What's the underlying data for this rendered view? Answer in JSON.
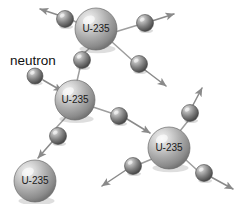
{
  "figure": {
    "name": "nuclear-fission-chain-reaction",
    "background_color": "#ffffff",
    "width": 241,
    "height": 204,
    "colors": {
      "sphere_light": "#e8e8e8",
      "sphere_mid": "#9a9a9a",
      "sphere_dark": "#5a5a5a",
      "neutron_light": "#d8d8d8",
      "neutron_mid": "#7d7d7d",
      "neutron_dark": "#3c3c3c",
      "arrow": "#8a8a8a",
      "link": "#9e9e9e",
      "text": "#111111",
      "outline": "#6b6b6b"
    }
  },
  "labels": {
    "neutron_caption": "neutron",
    "atom_symbol": "U-235"
  },
  "atoms": [
    {
      "id": "u235-top",
      "label": "U-235",
      "cx": 96,
      "cy": 29,
      "r": 21
    },
    {
      "id": "u235-middle",
      "label": "U-235",
      "cx": 75,
      "cy": 100,
      "r": 20
    },
    {
      "id": "u235-right",
      "label": "U-235",
      "cx": 169,
      "cy": 148,
      "r": 21
    },
    {
      "id": "u235-bottom-left",
      "label": "U-235",
      "cx": 35,
      "cy": 181,
      "r": 21
    }
  ],
  "neutrons": [
    {
      "id": "neutron-incoming",
      "cx": 35,
      "cy": 76,
      "r": 8
    },
    {
      "id": "neutron-mid-to-top",
      "cx": 82,
      "cy": 60,
      "r": 8.5
    },
    {
      "id": "neutron-top-left",
      "cx": 65,
      "cy": 19,
      "r": 8.5
    },
    {
      "id": "neutron-top-right",
      "cx": 145,
      "cy": 23,
      "r": 8.5
    },
    {
      "id": "neutron-top-lower-right",
      "cx": 139,
      "cy": 64,
      "r": 8.5
    },
    {
      "id": "neutron-mid-to-right",
      "cx": 119,
      "cy": 116,
      "r": 8.5
    },
    {
      "id": "neutron-mid-to-bottom",
      "cx": 58,
      "cy": 136,
      "r": 8.5
    },
    {
      "id": "neutron-right-upper",
      "cx": 190,
      "cy": 113,
      "r": 8.5
    },
    {
      "id": "neutron-right-lower-left",
      "cx": 133,
      "cy": 166,
      "r": 8.5
    },
    {
      "id": "neutron-right-lower-right",
      "cx": 204,
      "cy": 173,
      "r": 8.5
    }
  ],
  "links": [
    {
      "id": "link-top-to-topleft-neutron",
      "x1": 78,
      "y1": 23,
      "x2": 72,
      "y2": 20
    },
    {
      "id": "link-top-to-topright-neutron",
      "x1": 115,
      "y1": 32,
      "x2": 138,
      "y2": 25
    },
    {
      "id": "link-top-to-lowerright-neutron",
      "x1": 112,
      "y1": 42,
      "x2": 132,
      "y2": 60
    },
    {
      "id": "link-top-to-midneutron",
      "x1": 90,
      "y1": 48,
      "x2": 84,
      "y2": 53
    },
    {
      "id": "link-midneutron-to-mid",
      "x1": 80,
      "y1": 68,
      "x2": 77,
      "y2": 81
    },
    {
      "id": "link-mid-to-rightneutron",
      "x1": 93,
      "y1": 107,
      "x2": 111,
      "y2": 113
    },
    {
      "id": "link-mid-to-bottomneutron",
      "x1": 66,
      "y1": 117,
      "x2": 56,
      "y2": 128
    },
    {
      "id": "link-right-to-upperneutron",
      "x1": 180,
      "y1": 131,
      "x2": 188,
      "y2": 121
    },
    {
      "id": "link-right-to-lowerleftneutron",
      "x1": 152,
      "y1": 159,
      "x2": 140,
      "y2": 164
    },
    {
      "id": "link-right-to-lowerrightneutron",
      "x1": 186,
      "y1": 160,
      "x2": 197,
      "y2": 170
    }
  ],
  "arrows": [
    {
      "id": "arrow-incoming-neutron",
      "x1": 43,
      "y1": 80,
      "x2": 62,
      "y2": 91,
      "head": "end"
    },
    {
      "id": "arrow-escape-top-left",
      "x1": 58,
      "y1": 15,
      "x2": 40,
      "y2": 9,
      "head": "end"
    },
    {
      "id": "arrow-escape-top-right",
      "x1": 152,
      "y1": 21,
      "x2": 174,
      "y2": 14,
      "head": "end"
    },
    {
      "id": "arrow-escape-lower-right",
      "x1": 145,
      "y1": 70,
      "x2": 166,
      "y2": 86,
      "head": "end"
    },
    {
      "id": "arrow-mid-to-right-atom",
      "x1": 127,
      "y1": 119,
      "x2": 150,
      "y2": 133,
      "head": "end"
    },
    {
      "id": "arrow-mid-to-bottom-atom",
      "x1": 52,
      "y1": 142,
      "x2": 38,
      "y2": 158,
      "head": "end"
    },
    {
      "id": "arrow-escape-right-upper",
      "x1": 193,
      "y1": 105,
      "x2": 202,
      "y2": 88,
      "head": "end"
    },
    {
      "id": "arrow-escape-right-lower-left",
      "x1": 126,
      "y1": 170,
      "x2": 102,
      "y2": 186,
      "head": "end"
    },
    {
      "id": "arrow-escape-right-lower-right",
      "x1": 211,
      "y1": 177,
      "x2": 233,
      "y2": 189,
      "head": "end"
    }
  ],
  "caption": {
    "text": "neutron",
    "x": 10,
    "y": 61
  }
}
